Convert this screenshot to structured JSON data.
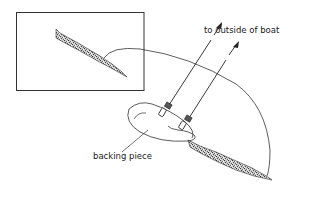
{
  "diagram": {
    "type": "cross-section illustration",
    "labels": {
      "outside": "to outside of boat",
      "backing": "backing piece"
    },
    "colors": {
      "line": "#222222",
      "frame": "#333333",
      "background": "#ffffff",
      "hull_texture": "#9a9a9a"
    }
  }
}
